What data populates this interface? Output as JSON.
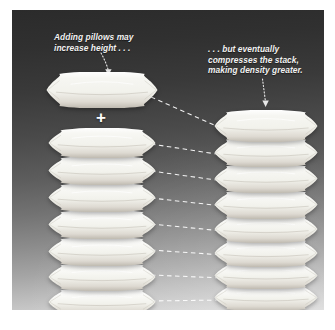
{
  "figure": {
    "panel": {
      "background_top_color": "#2b2b2b",
      "background_bottom_color": "#dadada",
      "border_color": "#ffffff"
    }
  },
  "annotations": [
    {
      "id": "left",
      "text": "Adding pillows may\nincrease height . . .",
      "color": "#f2f2f2",
      "pointer": "dotted-arrow-down"
    },
    {
      "id": "right",
      "text": ". . . but eventually\ncompresses the stack,\nmaking density greater.",
      "color": "#f2f2f2",
      "pointer": "dotted-arrow-down"
    }
  ],
  "operator": {
    "symbol": "+",
    "color": "#ffffff"
  },
  "chart_data": {
    "type": "diagram",
    "left_stack": {
      "label": "uncompressed stack",
      "added_pillow_count": 1,
      "stacked_pillow_count": 7,
      "pillow_height_px": 27,
      "pillow_width_px": 104,
      "spacing_px": 27
    },
    "right_stack": {
      "label": "compressed stack",
      "stacked_pillow_count": 8,
      "pillow_height_px": 26,
      "pillow_width_px": 100,
      "spacing_px": 24
    },
    "connectors": {
      "style": "dashed",
      "color": "#ffffff",
      "count": 8
    }
  },
  "pillows": {
    "left_top": [
      {
        "x": 34,
        "y": 62,
        "w": 112,
        "h": 36,
        "fill": "#f6f6f2"
      }
    ],
    "left_stack": [
      {
        "x": 36,
        "y": 118,
        "w": 108,
        "h": 30,
        "fill": "#f7f7f3"
      },
      {
        "x": 36,
        "y": 146,
        "w": 108,
        "h": 29,
        "fill": "#f8f8f5"
      },
      {
        "x": 36,
        "y": 173,
        "w": 108,
        "h": 29,
        "fill": "#f9f9f6"
      },
      {
        "x": 36,
        "y": 200,
        "w": 108,
        "h": 29,
        "fill": "#fafaf8"
      },
      {
        "x": 36,
        "y": 227,
        "w": 108,
        "h": 29,
        "fill": "#fbfbf9"
      },
      {
        "x": 36,
        "y": 253,
        "w": 108,
        "h": 28,
        "fill": "#fcfcfa"
      },
      {
        "x": 36,
        "y": 278,
        "w": 108,
        "h": 28,
        "fill": "#fdfdfc"
      }
    ],
    "right_stack": [
      {
        "x": 202,
        "y": 100,
        "w": 104,
        "h": 32,
        "fill": "#f6f6f2"
      },
      {
        "x": 202,
        "y": 128,
        "w": 104,
        "h": 29,
        "fill": "#f7f7f4"
      },
      {
        "x": 202,
        "y": 154,
        "w": 104,
        "h": 29,
        "fill": "#f8f8f5"
      },
      {
        "x": 202,
        "y": 180,
        "w": 104,
        "h": 29,
        "fill": "#f9f9f7"
      },
      {
        "x": 202,
        "y": 205,
        "w": 104,
        "h": 28,
        "fill": "#fafaf8"
      },
      {
        "x": 202,
        "y": 229,
        "w": 104,
        "h": 28,
        "fill": "#fbfbfa"
      },
      {
        "x": 202,
        "y": 252,
        "w": 104,
        "h": 27,
        "fill": "#fcfcfb"
      },
      {
        "x": 202,
        "y": 274,
        "w": 104,
        "h": 27,
        "fill": "#fdfdfd"
      }
    ]
  },
  "connector_lines": [
    {
      "x1": 139,
      "y1": 87,
      "x2": 211,
      "y2": 119
    },
    {
      "x1": 139,
      "y1": 134,
      "x2": 211,
      "y2": 145
    },
    {
      "x1": 139,
      "y1": 161,
      "x2": 211,
      "y2": 171
    },
    {
      "x1": 139,
      "y1": 188,
      "x2": 211,
      "y2": 196
    },
    {
      "x1": 139,
      "y1": 214,
      "x2": 211,
      "y2": 221
    },
    {
      "x1": 139,
      "y1": 240,
      "x2": 211,
      "y2": 245
    },
    {
      "x1": 139,
      "y1": 265,
      "x2": 211,
      "y2": 268
    },
    {
      "x1": 139,
      "y1": 291,
      "x2": 211,
      "y2": 290
    }
  ]
}
